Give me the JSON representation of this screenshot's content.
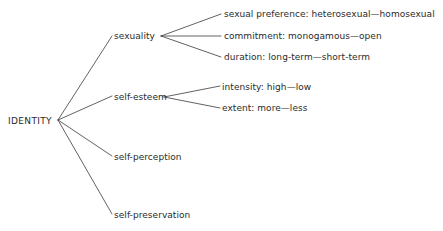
{
  "diagram": {
    "type": "tree",
    "title": "IDENTITY",
    "root": {
      "label": "IDENTITY",
      "x": 8,
      "y": 116
    },
    "fan_origin": {
      "x": 58,
      "y": 120
    },
    "branches": [
      {
        "id": "sexuality",
        "label": "sexuality",
        "x": 114,
        "y": 31,
        "fan_origin": {
          "x": 161,
          "y": 36
        },
        "children": [
          {
            "id": "sexual-preference",
            "label": "sexual preference: heterosexual—homosexual",
            "x": 224,
            "y": 9
          },
          {
            "id": "commitment",
            "label": "commitment: monogamous—open",
            "x": 224,
            "y": 31
          },
          {
            "id": "duration",
            "label": "duration: long-term—short-term",
            "x": 224,
            "y": 52
          }
        ]
      },
      {
        "id": "self-esteem",
        "label": "self-esteem",
        "x": 114,
        "y": 92,
        "fan_origin": {
          "x": 164,
          "y": 97
        },
        "children": [
          {
            "id": "intensity",
            "label": "intensity: high—low",
            "x": 222,
            "y": 82
          },
          {
            "id": "extent",
            "label": "extent: more—less",
            "x": 222,
            "y": 103
          }
        ]
      },
      {
        "id": "self-perception",
        "label": "self-perception",
        "x": 114,
        "y": 152,
        "children": []
      },
      {
        "id": "self-preservation",
        "label": "self-preservation",
        "x": 114,
        "y": 210,
        "children": []
      }
    ],
    "colors": {
      "background": "#ffffff",
      "text": "#2b2b2b",
      "line": "#3a3a3a"
    }
  }
}
